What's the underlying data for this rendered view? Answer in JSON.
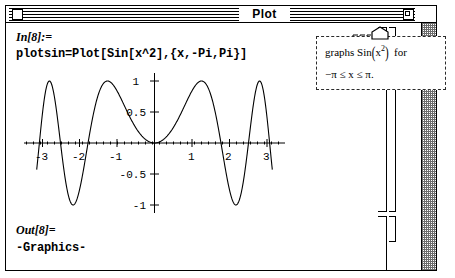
{
  "window": {
    "title": "Plot",
    "close_box": "close-box",
    "zoom_box": "zoom-box"
  },
  "notebook": {
    "input_label": "In[8]:=",
    "input_code": "plotsin=Plot[Sin[x^2],{x,-Pi,Pi}]",
    "output_label": "Out[8]=",
    "output_text": "-Graphics-"
  },
  "callout": {
    "line1_pre": "graphs  Sin",
    "line1_open": "(",
    "line1_arg": "x",
    "line1_exp": "2",
    "line1_close": ")",
    "line1_post": "for",
    "line2": "−π ≤ x ≤ π."
  },
  "chart_data": {
    "type": "line",
    "title": "",
    "xlabel": "",
    "ylabel": "",
    "function": "Sin(x^2)",
    "xlim": [
      -3.4,
      3.4
    ],
    "ylim": [
      -1.12,
      1.12
    ],
    "xticks": [
      -3,
      -2,
      -1,
      1,
      2,
      3
    ],
    "xtick_labels": [
      "-3",
      "-2",
      "-1",
      "1",
      "2",
      "3"
    ],
    "yticks": [
      -1,
      -0.5,
      0.5,
      1
    ],
    "ytick_labels": [
      "-1",
      "-0.5",
      "0.5",
      "1"
    ],
    "grid": false,
    "legend": "none",
    "axes_style": "crosshair-centered",
    "series": [
      {
        "name": "Sin(x^2)",
        "color": "#000000",
        "x_min": -3.14159,
        "x_max": 3.14159,
        "samples": 600
      }
    ]
  },
  "colors": {
    "window_bg": "#ffffff",
    "ink": "#000000",
    "scrollbar_dither": "#6d6d6d"
  }
}
